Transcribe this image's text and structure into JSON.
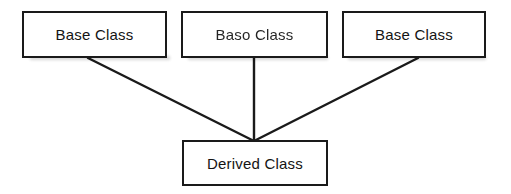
{
  "diagram": {
    "background_color": "#ffffff",
    "line_color": "#1a1a1a",
    "border_color": "#1a1a1a",
    "text_color": "#141414",
    "nodes": [
      {
        "id": "base-class-1",
        "label": "Base Class",
        "role": "base",
        "x": 22,
        "y": 11,
        "width": 145,
        "height": 47
      },
      {
        "id": "base-class-2",
        "label": "Baso Class",
        "role": "base",
        "x": 181,
        "y": 11,
        "width": 147,
        "height": 47
      },
      {
        "id": "base-class-3",
        "label": "Base Class",
        "role": "base",
        "x": 342,
        "y": 11,
        "width": 144,
        "height": 47
      },
      {
        "id": "derived-class",
        "label": "Derived Class",
        "role": "derived",
        "x": 182,
        "y": 140,
        "width": 146,
        "height": 46
      }
    ],
    "connectors": [
      {
        "id": "edge-base1-derived",
        "from": "base-class-1",
        "to": "derived-class",
        "x1": 88,
        "y1": 58,
        "x2": 254,
        "y2": 141
      },
      {
        "id": "edge-base2-derived",
        "from": "base-class-2",
        "to": "derived-class",
        "x1": 254,
        "y1": 58,
        "x2": 254,
        "y2": 141
      },
      {
        "id": "edge-base3-derived",
        "from": "base-class-3",
        "to": "derived-class",
        "x1": 418,
        "y1": 58,
        "x2": 254,
        "y2": 141
      }
    ]
  }
}
